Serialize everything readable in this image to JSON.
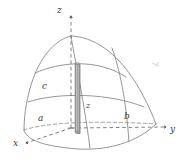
{
  "figure": {
    "background_color": "#ffffff",
    "line_color": "#8a8a8a",
    "dashed_color": "#8c8c8c",
    "label_color": "#3a3a3a",
    "element_fill_color": "#b9b9b9",
    "element_edge_color": "#6b6b6b"
  },
  "axes": {
    "x": {
      "label": "x",
      "x": 13,
      "y": 139
    },
    "y": {
      "label": "y",
      "x": 170,
      "y": 125
    },
    "z": {
      "label": "z",
      "x": 57,
      "y": 6
    }
  },
  "dimensions": [
    {
      "name": "semi-axis-a",
      "label": "a",
      "x": 38,
      "y": 114
    },
    {
      "name": "semi-axis-b",
      "label": "b",
      "x": 124,
      "y": 112
    },
    {
      "name": "semi-axis-c",
      "label": "c",
      "x": 42,
      "y": 82
    }
  ],
  "element": {
    "name": "differential-column",
    "label": "z",
    "label_x": 86,
    "label_y": 102
  }
}
